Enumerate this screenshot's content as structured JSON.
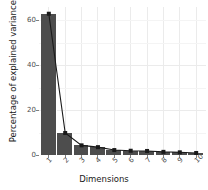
{
  "chart_data": {
    "type": "bar",
    "title": "",
    "subtitle": "",
    "xlabel": "Dimensions",
    "ylabel": "Percentage of explained variances",
    "categories": [
      "1",
      "2",
      "3",
      "4",
      "5",
      "6",
      "7",
      "8",
      "9",
      "10"
    ],
    "values": [
      63.0,
      9.8,
      4.3,
      3.5,
      2.2,
      1.9,
      1.8,
      1.4,
      1.2,
      0.9
    ],
    "series": [
      {
        "name": "Percentage of explained variances (bars)",
        "type": "bar",
        "values": [
          63.0,
          9.8,
          4.3,
          3.5,
          2.2,
          1.9,
          1.8,
          1.4,
          1.2,
          0.9
        ]
      },
      {
        "name": "Scree line",
        "type": "line",
        "values": [
          63.0,
          9.8,
          4.3,
          3.5,
          2.2,
          1.9,
          1.8,
          1.4,
          1.2,
          0.9
        ]
      }
    ],
    "ylim": [
      0,
      66
    ],
    "xlim": [
      0.4,
      10.6
    ],
    "yticks": [
      0,
      20,
      40,
      60
    ],
    "ytick_labels": [
      "0",
      "20",
      "40",
      "60"
    ],
    "xtick_labels": [
      "1",
      "2",
      "3",
      "4",
      "5",
      "6",
      "7",
      "8",
      "9",
      "10"
    ],
    "grid": true,
    "grid_color": "#ebebeb",
    "legend": "none",
    "bar_color": "#4d4d4d",
    "line_color": "#1a1a1a",
    "point_color": "#1a1a1a",
    "panel_background": "#ffffff",
    "text_color": "#1a1a1a",
    "tick_label_color": "#4d4d4d",
    "xtick_label_angle": -45
  }
}
